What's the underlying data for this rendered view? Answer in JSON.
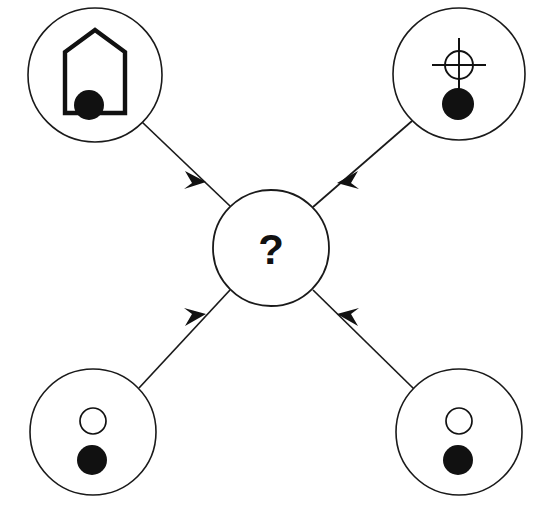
{
  "diagram": {
    "background_color": "#ffffff",
    "stroke_color": "#1a1a1a",
    "fill_color": "#111111",
    "center_node": {
      "id": "center",
      "label": "?",
      "name": "unknown-object",
      "cx": 271,
      "cy": 248,
      "r": 58
    },
    "nodes": [
      {
        "id": "top-left",
        "name": "arch-with-filled-dot",
        "icon": "arch-shape-icon",
        "description": "Pointed arch outline with filled black circle at bottom",
        "cx": 95,
        "cy": 75,
        "r": 67
      },
      {
        "id": "top-right",
        "name": "crosshair-with-filled-dot",
        "icon": "crosshair-icon",
        "description": "Crosshair target symbol above filled black circle",
        "cx": 459,
        "cy": 74,
        "r": 66
      },
      {
        "id": "bottom-left",
        "name": "hollow-dot-over-filled-dot",
        "icon": "two-circles-icon",
        "description": "Small hollow circle above filled black circle",
        "cx": 93,
        "cy": 432,
        "r": 63
      },
      {
        "id": "bottom-right",
        "name": "hollow-dot-over-filled-dot",
        "icon": "two-circles-icon",
        "description": "Small hollow circle above filled black circle",
        "cx": 459,
        "cy": 432,
        "r": 63
      }
    ],
    "edges": [
      {
        "id": "edge-top-left",
        "from": "top-left",
        "to": "center",
        "direction": "to-center",
        "arrowhead": "filled-triangle",
        "x1": 142,
        "y1": 122,
        "x2": 230,
        "y2": 206,
        "arrow_x": 197,
        "arrow_y": 173
      },
      {
        "id": "edge-top-right",
        "from": "top-right",
        "to": "center",
        "direction": "to-center",
        "arrowhead": "filled-triangle",
        "x1": 412,
        "y1": 121,
        "x2": 313,
        "y2": 207,
        "arrow_x": 347,
        "arrow_y": 172
      },
      {
        "id": "edge-bottom-left",
        "from": "bottom-left",
        "to": "center",
        "direction": "to-center",
        "arrowhead": "filled-triangle",
        "x1": 139,
        "y1": 388,
        "x2": 230,
        "y2": 290,
        "arrow_x": 196,
        "arrow_y": 327
      },
      {
        "id": "edge-bottom-right",
        "from": "bottom-right",
        "to": "center",
        "direction": "to-center",
        "arrowhead": "filled-triangle",
        "x1": 414,
        "y1": 389,
        "x2": 313,
        "y2": 290,
        "arrow_x": 348,
        "arrow_y": 326
      }
    ]
  }
}
